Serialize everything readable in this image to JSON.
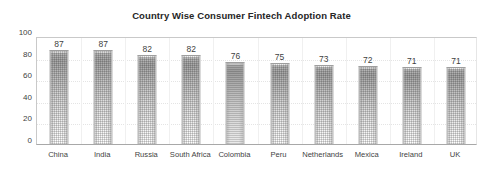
{
  "chart_data": {
    "type": "bar",
    "title": "Country Wise Consumer Fintech Adoption Rate",
    "xlabel": "",
    "ylabel": "",
    "categories": [
      "China",
      "India",
      "Russia",
      "South Africa",
      "Colombia",
      "Peru",
      "Netherlands",
      "Mexica",
      "Ireland",
      "UK"
    ],
    "values": [
      87,
      87,
      82,
      82,
      76,
      75,
      73,
      72,
      71,
      71
    ],
    "data_labels": [
      "87",
      "87",
      "82",
      "82",
      "76",
      "75",
      "73",
      "72",
      "71",
      "71"
    ],
    "ylim": [
      0,
      100
    ],
    "ytick_labels": [
      "0",
      "20",
      "40",
      "60",
      "80",
      "100"
    ],
    "ytick_values": [
      0,
      20,
      40,
      60,
      80,
      100
    ],
    "grid": "horizontal-faint",
    "legend": "none",
    "series": [
      {
        "name": "Adoption Rate",
        "values": [
          87,
          87,
          82,
          82,
          76,
          75,
          73,
          72,
          71,
          71
        ]
      }
    ],
    "colors": {
      "bar_top": "#a9a9a9",
      "bar_bottom": "#ffffff",
      "bar_outline": "#b5b5b5",
      "axis": "#a8a8a8",
      "grid": "#e4e4e4",
      "text": "#3f3f3f",
      "title": "#262626",
      "background": "#ffffff"
    }
  }
}
